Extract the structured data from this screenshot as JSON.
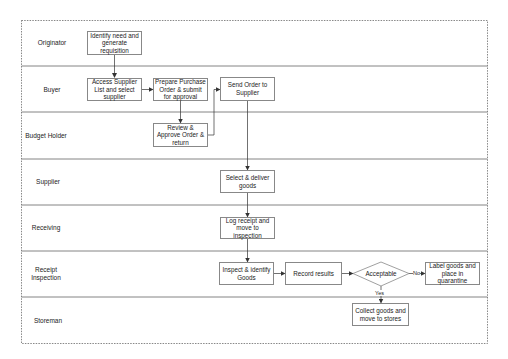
{
  "diagram": {
    "type": "swimlane-flowchart",
    "lanes": [
      {
        "id": "originator",
        "label": "Originator"
      },
      {
        "id": "buyer",
        "label": "Buyer"
      },
      {
        "id": "budget_holder",
        "label": "Budget Holder"
      },
      {
        "id": "supplier",
        "label": "Supplier"
      },
      {
        "id": "receiving",
        "label": "Receiving"
      },
      {
        "id": "receipt_inspection",
        "label": "Receipt Inspection"
      },
      {
        "id": "storeman",
        "label": "Storeman"
      }
    ],
    "nodes": {
      "identify": {
        "label": "Identify need and generate requisition",
        "lane": "originator"
      },
      "access": {
        "label": "Access Supplier List and select supplier",
        "lane": "buyer"
      },
      "prepare": {
        "label": "Prepare Purchase Order & submit for approval",
        "lane": "buyer"
      },
      "send": {
        "label": "Send Order to Supplier",
        "lane": "buyer"
      },
      "review": {
        "label": "Review & Approve Order & return",
        "lane": "budget_holder"
      },
      "select": {
        "label": "Select & deliver goods",
        "lane": "supplier"
      },
      "log": {
        "label": "Log receipt and move to inspection",
        "lane": "receiving"
      },
      "inspect": {
        "label": "Inspect & identify Goods",
        "lane": "receipt_inspection"
      },
      "record": {
        "label": "Record results",
        "lane": "receipt_inspection"
      },
      "acceptable": {
        "label": "Acceptable",
        "lane": "receipt_inspection",
        "shape": "diamond"
      },
      "label_goods": {
        "label": "Label goods and place in quarantine",
        "lane": "receipt_inspection"
      },
      "collect": {
        "label": "Collect goods and move to stores",
        "lane": "storeman"
      }
    },
    "edges": [
      {
        "from": "identify",
        "to": "access"
      },
      {
        "from": "access",
        "to": "prepare"
      },
      {
        "from": "prepare",
        "to": "review"
      },
      {
        "from": "review",
        "to": "send"
      },
      {
        "from": "send",
        "to": "select"
      },
      {
        "from": "select",
        "to": "log"
      },
      {
        "from": "log",
        "to": "inspect"
      },
      {
        "from": "inspect",
        "to": "record"
      },
      {
        "from": "record",
        "to": "acceptable"
      },
      {
        "from": "acceptable",
        "to": "label_goods",
        "label": "No"
      },
      {
        "from": "acceptable",
        "to": "collect",
        "label": "Yes"
      }
    ],
    "edge_labels": {
      "no": "No",
      "yes": "Yes"
    }
  }
}
